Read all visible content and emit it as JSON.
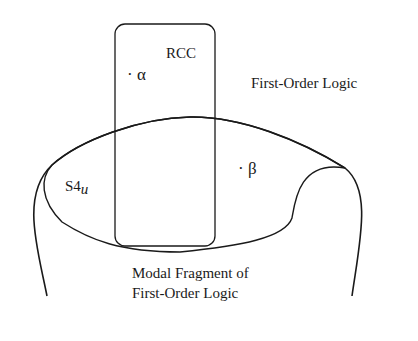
{
  "diagram": {
    "regions": {
      "rcc": {
        "label": "RCC"
      },
      "s4u": {
        "label": "S4",
        "subscript": "u"
      },
      "fol": {
        "label": "First-Order Logic"
      },
      "modal_fragment": {
        "line1": "Modal Fragment of",
        "line2": "First-Order Logic"
      }
    },
    "points": {
      "alpha": "· α",
      "beta": "· β"
    },
    "colors": {
      "stroke": "#1a1a1a",
      "background": "#ffffff"
    }
  }
}
